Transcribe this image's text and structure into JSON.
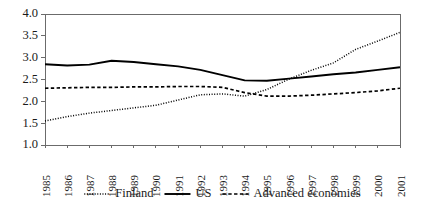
{
  "chart_data": {
    "type": "line",
    "title": "",
    "subtitle": "",
    "xlabel": "",
    "ylabel": "",
    "ylim": [
      1.0,
      4.0
    ],
    "ytick_step": 0.5,
    "ytick_labels": [
      "1.0",
      "1.5",
      "2.0",
      "2.5",
      "3.0",
      "3.5",
      "4.0"
    ],
    "ytick_values": [
      1.0,
      1.5,
      2.0,
      2.5,
      3.0,
      3.5,
      4.0
    ],
    "grid": false,
    "legend_position": "bottom",
    "categories": [
      "1985",
      "1986",
      "1987",
      "1988",
      "1989",
      "1990",
      "1991",
      "1992",
      "1993",
      "1994",
      "1995",
      "1996",
      "1997",
      "1998",
      "1999",
      "2000",
      "2001"
    ],
    "x": [
      1985,
      1986,
      1987,
      1988,
      1989,
      1990,
      1991,
      1992,
      1993,
      1994,
      1995,
      1996,
      1997,
      1998,
      1999,
      2000,
      2001
    ],
    "series": [
      {
        "name": "Finland",
        "style": "dotted",
        "color": "#000000",
        "values": [
          1.55,
          1.65,
          1.73,
          1.79,
          1.85,
          1.91,
          2.03,
          2.15,
          2.17,
          2.12,
          2.27,
          2.51,
          2.71,
          2.88,
          3.19,
          3.38,
          3.58
        ]
      },
      {
        "name": "US",
        "style": "solid",
        "color": "#000000",
        "values": [
          2.85,
          2.82,
          2.84,
          2.93,
          2.9,
          2.85,
          2.8,
          2.72,
          2.6,
          2.48,
          2.47,
          2.52,
          2.57,
          2.62,
          2.66,
          2.72,
          2.78
        ]
      },
      {
        "name": "Advanced economies",
        "style": "dashed",
        "color": "#000000",
        "values": [
          2.3,
          2.31,
          2.32,
          2.32,
          2.33,
          2.33,
          2.34,
          2.34,
          2.32,
          2.2,
          2.12,
          2.12,
          2.14,
          2.17,
          2.2,
          2.24,
          2.3
        ]
      }
    ]
  },
  "legend": {
    "items": [
      {
        "label": "Finland",
        "style": "dotted"
      },
      {
        "label": "US",
        "style": "solid"
      },
      {
        "label": "Advanced economies",
        "style": "dashed"
      }
    ]
  },
  "plot_frame": {
    "left": 45,
    "right": 400,
    "top": 14,
    "bottom": 145
  }
}
